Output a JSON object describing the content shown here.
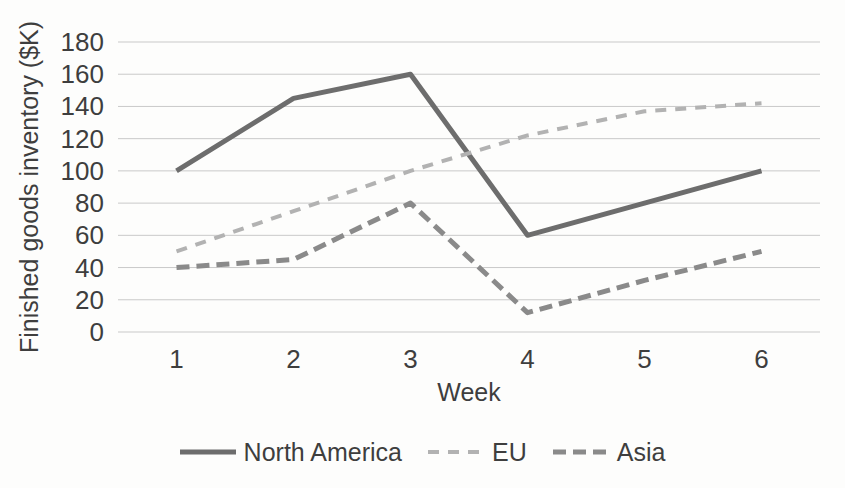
{
  "chart_data": {
    "type": "line",
    "title": "",
    "xlabel": "Week",
    "ylabel": "Finished goods inventory ($K)",
    "x_categories": [
      "1",
      "2",
      "3",
      "4",
      "5",
      "6"
    ],
    "ylim": [
      0,
      180
    ],
    "ytick_step": 20,
    "grid": "horizontal-only",
    "gridline_color": "#c9c9c9",
    "text_color": "#3e3e3e",
    "background_color": "#fdfdfc",
    "legend_position": "bottom-center",
    "series": [
      {
        "name": "North America",
        "values": [
          100,
          145,
          160,
          60,
          80,
          100
        ],
        "color": "#6d6d6d",
        "line_style": "solid",
        "dash_pattern": "",
        "stroke_width": 5
      },
      {
        "name": "EU",
        "values": [
          50,
          75,
          100,
          122,
          137,
          142
        ],
        "color": "#b2b2b2",
        "line_style": "dashed",
        "dash_pattern": "11 9",
        "stroke_width": 4
      },
      {
        "name": "Asia",
        "values": [
          40,
          45,
          80,
          12,
          32,
          50
        ],
        "color": "#8a8a8a",
        "line_style": "dashed",
        "dash_pattern": "13 7",
        "stroke_width": 5
      }
    ]
  }
}
